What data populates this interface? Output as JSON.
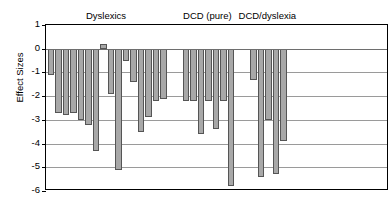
{
  "chart": {
    "y_axis_title": "Effect Sizes",
    "tick_labels": [
      "1",
      "0",
      "-1",
      "-2",
      "-3",
      "-4",
      "-5",
      "-6"
    ],
    "group_labels": [
      "Dyslexics",
      "DCD (pure)",
      "DCD/dyslexia"
    ],
    "bar_fill_color": "#a8a8a8",
    "bar_border_color": "#555555",
    "grid_color": "#9a9a9a",
    "axis_color": "#000000"
  },
  "chart_data": {
    "type": "bar",
    "title": "",
    "subtitle": "",
    "xlabel": "",
    "ylabel": "Effect Sizes",
    "ylim": [
      -6,
      1
    ],
    "yticks": [
      1,
      0,
      -1,
      -2,
      -3,
      -4,
      -5,
      -6
    ],
    "grid": true,
    "legend": "none",
    "groups": [
      {
        "name": "Dyslexics",
        "values": [
          -1.1,
          -2.7,
          -2.8,
          -2.7,
          -3.0,
          -3.2,
          -4.3,
          0.2,
          -1.9,
          -5.1,
          -0.5,
          -1.4,
          -3.5,
          -2.9,
          -2.2,
          -2.1
        ]
      },
      {
        "name": "DCD (pure)",
        "values": [
          -2.2,
          -2.2,
          -3.6,
          -2.2,
          -3.4,
          -2.2,
          -5.8
        ]
      },
      {
        "name": "DCD/dyslexia",
        "values": [
          -1.3,
          -5.4,
          -3.0,
          -5.3,
          -3.9
        ]
      }
    ],
    "categories": [
      "Dyslexics",
      "Dyslexics",
      "Dyslexics",
      "Dyslexics",
      "Dyslexics",
      "Dyslexics",
      "Dyslexics",
      "Dyslexics",
      "Dyslexics",
      "Dyslexics",
      "Dyslexics",
      "Dyslexics",
      "Dyslexics",
      "Dyslexics",
      "Dyslexics",
      "Dyslexics",
      "DCD (pure)",
      "DCD (pure)",
      "DCD (pure)",
      "DCD (pure)",
      "DCD (pure)",
      "DCD (pure)",
      "DCD (pure)",
      "DCD/dyslexia",
      "DCD/dyslexia",
      "DCD/dyslexia",
      "DCD/dyslexia",
      "DCD/dyslexia"
    ],
    "values": [
      -1.1,
      -2.7,
      -2.8,
      -2.7,
      -3.0,
      -3.2,
      -4.3,
      0.2,
      -1.9,
      -5.1,
      -0.5,
      -1.4,
      -3.5,
      -2.9,
      -2.2,
      -2.1,
      -2.2,
      -2.2,
      -3.6,
      -2.2,
      -3.4,
      -2.2,
      -5.8,
      -1.3,
      -5.4,
      -3.0,
      -5.3,
      -3.9
    ]
  }
}
